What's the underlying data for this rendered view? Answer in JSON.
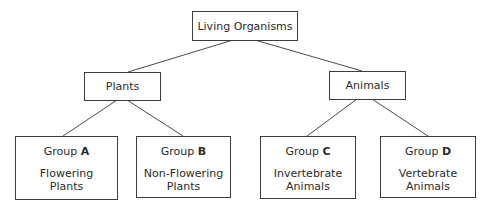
{
  "diagram": {
    "type": "hierarchy-tree",
    "root": {
      "label": "Living Organisms"
    },
    "level1": [
      {
        "id": "plants",
        "label": "Plants"
      },
      {
        "id": "animals",
        "label": "Animals"
      }
    ],
    "groups": [
      {
        "parent": "plants",
        "prefix": "Group",
        "letter": "A",
        "desc_line1": "Flowering",
        "desc_line2": "Plants"
      },
      {
        "parent": "plants",
        "prefix": "Group",
        "letter": "B",
        "desc_line1": "Non-Flowering",
        "desc_line2": "Plants"
      },
      {
        "parent": "animals",
        "prefix": "Group",
        "letter": "C",
        "desc_line1": "Invertebrate",
        "desc_line2": "Animals"
      },
      {
        "parent": "animals",
        "prefix": "Group",
        "letter": "D",
        "desc_line1": "Vertebrate",
        "desc_line2": "Animals"
      }
    ],
    "colors": {
      "background": "#ffffff",
      "box_border": "#3c3c3c",
      "connector": "#4a4a4a",
      "text": "#2b2b2b"
    }
  }
}
